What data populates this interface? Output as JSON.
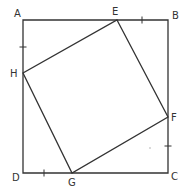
{
  "figure": {
    "stroke_color": "#333333",
    "background": "#ffffff"
  },
  "points": {
    "A": {
      "label": "A",
      "x": 23,
      "y": 20,
      "label_x": 14,
      "label_y": 17
    },
    "B": {
      "label": "B",
      "x": 168,
      "y": 20,
      "label_x": 172,
      "label_y": 19
    },
    "C": {
      "label": "C",
      "x": 168,
      "y": 173,
      "label_x": 171,
      "label_y": 180
    },
    "D": {
      "label": "D",
      "x": 23,
      "y": 173,
      "label_x": 12,
      "label_y": 181
    },
    "E": {
      "label": "E",
      "x": 117,
      "y": 20,
      "label_x": 112,
      "label_y": 15
    },
    "F": {
      "label": "F",
      "x": 168,
      "y": 117,
      "label_x": 171,
      "label_y": 121
    },
    "G": {
      "label": "G",
      "x": 72,
      "y": 173,
      "label_x": 68,
      "label_y": 186
    },
    "H": {
      "label": "H",
      "x": 23,
      "y": 73,
      "label_x": 10,
      "label_y": 77
    }
  },
  "outer_square": [
    "A",
    "B",
    "C",
    "D"
  ],
  "inner_quadrilateral": [
    "E",
    "F",
    "G",
    "H"
  ],
  "tick_marks": [
    {
      "segment": "AH",
      "x": 23,
      "y": 47,
      "orientation": "horizontal"
    },
    {
      "segment": "EB",
      "x": 142,
      "y": 20,
      "orientation": "vertical"
    },
    {
      "segment": "FC",
      "x": 168,
      "y": 146,
      "orientation": "horizontal"
    },
    {
      "segment": "DG",
      "x": 44,
      "y": 173,
      "orientation": "vertical"
    }
  ]
}
